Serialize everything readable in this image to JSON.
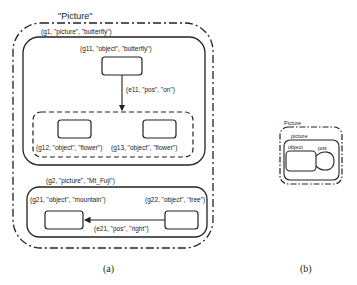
{
  "figure_a": {
    "caption": "(a)",
    "outer_frame": {
      "label": "\"Picture\""
    },
    "g1": {
      "label": "(g1, \"picture\", \"butterfly\")",
      "g11": {
        "label": "(g11, \"object\", \"butterfly\")"
      },
      "e11": {
        "label": "(e11, \"pos\", \"on\")"
      },
      "group": {
        "g12": {
          "label": "(g12, \"object\", \"flower\")"
        },
        "g13": {
          "label": "(g13, \"object\", \"flower\")"
        }
      }
    },
    "g2": {
      "label": "(g2, \"picture\", \"Mt_Fuji\")",
      "g21": {
        "label": "(g21, \"object\", \"mountain\")"
      },
      "g22": {
        "label": "(g22, \"object\", \"tree\")"
      },
      "e21": {
        "label": "(e21, \"pos\", \"right\")"
      }
    }
  },
  "figure_b": {
    "caption": "(b)",
    "outer_frame": {
      "label": "Picture"
    },
    "picture": {
      "label": "picture"
    },
    "object": {
      "label": "object"
    },
    "pos_loop": {
      "label": "pos"
    }
  },
  "colors": {
    "stroke": "#222222",
    "background": "#ffffff"
  }
}
